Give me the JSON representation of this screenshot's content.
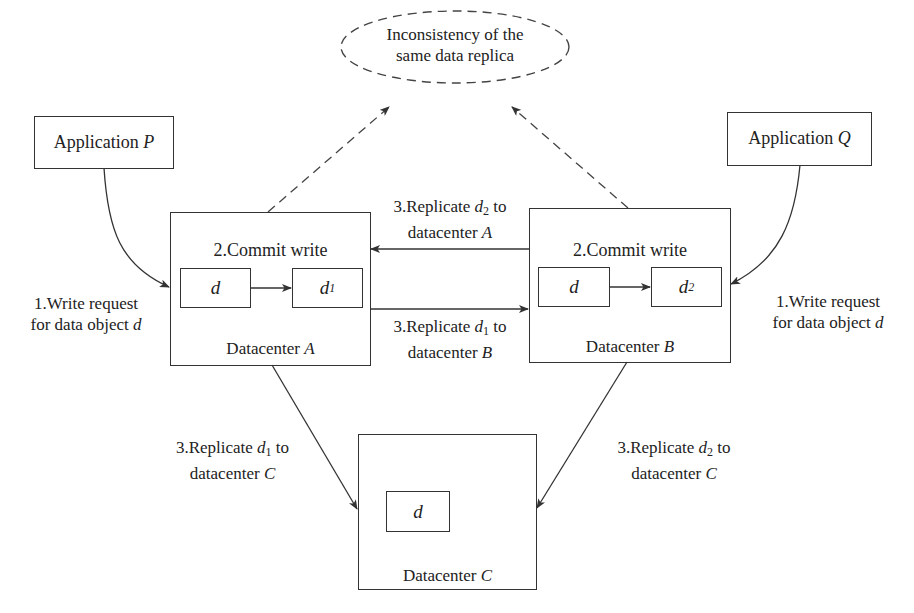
{
  "diagram": {
    "conflict_node": {
      "line1": "Inconsistency of the",
      "line2": "same data replica"
    },
    "applications": [
      {
        "prefix": "Application ",
        "name": "P"
      },
      {
        "prefix": "Application ",
        "name": "Q"
      }
    ],
    "datacenters": [
      {
        "prefix": "Datacenter ",
        "name": "A",
        "step_label": "2.Commit write",
        "original": "d",
        "updated_base": "d",
        "updated_sub": "1"
      },
      {
        "prefix": "Datacenter ",
        "name": "B",
        "step_label": "2.Commit write",
        "original": "d",
        "updated_base": "d",
        "updated_sub": "2"
      },
      {
        "prefix": "Datacenter ",
        "name": "C",
        "stored": "d"
      }
    ],
    "write_requests": [
      {
        "line1": "1.Write request",
        "line2_prefix": "for data object ",
        "line2_var": "d"
      },
      {
        "line1": "1.Write request",
        "line2_prefix": "for data object ",
        "line2_var": "d"
      }
    ],
    "replications": [
      {
        "id": "d2_to_A",
        "prefix": "3.Replicate ",
        "var": "d",
        "sub": "2",
        "suffix": " to",
        "line2_prefix": "datacenter ",
        "target": "A"
      },
      {
        "id": "d1_to_B",
        "prefix": "3.Replicate ",
        "var": "d",
        "sub": "1",
        "suffix": " to",
        "line2_prefix": "datacenter ",
        "target": "B"
      },
      {
        "id": "d1_to_C",
        "prefix": "3.Replicate ",
        "var": "d",
        "sub": "1",
        "suffix": " to",
        "line2_prefix": "datacenter ",
        "target": "C"
      },
      {
        "id": "d2_to_C",
        "prefix": "3.Replicate ",
        "var": "d",
        "sub": "2",
        "suffix": " to",
        "line2_prefix": "datacenter ",
        "target": "C"
      }
    ],
    "colors": {
      "stroke": "#333333",
      "text": "#222222",
      "background": "#ffffff"
    }
  }
}
